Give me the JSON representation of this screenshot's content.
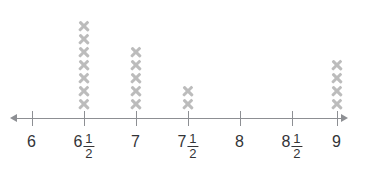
{
  "chart_data": {
    "type": "scatter",
    "plot_style": "line-plot-x-marks",
    "title": "",
    "subtitle": "",
    "xlabel": "",
    "ylabel": "",
    "grid": false,
    "legend": "none",
    "xlim": [
      6,
      9
    ],
    "categories": [
      "6",
      "6½",
      "7",
      "7½",
      "8",
      "8½",
      "9"
    ],
    "x": [
      6,
      6.5,
      7,
      7.5,
      8,
      8.5,
      9
    ],
    "values": [
      0,
      7,
      5,
      2,
      0,
      0,
      4
    ],
    "marker": "x",
    "marker_color": "#bcbcbc",
    "axis_color": "#8d8f93",
    "label_color": "#333437",
    "ticks": [
      {
        "id": "tick-6",
        "value": 6,
        "x_px": 32,
        "whole": "6",
        "numerator": "",
        "denominator": "",
        "count": 0
      },
      {
        "id": "tick-6-half",
        "value": 6.5,
        "x_px": 84,
        "whole": "6",
        "numerator": "1",
        "denominator": "2",
        "count": 7
      },
      {
        "id": "tick-7",
        "value": 7,
        "x_px": 136,
        "whole": "7",
        "numerator": "",
        "denominator": "",
        "count": 5
      },
      {
        "id": "tick-7-half",
        "value": 7.5,
        "x_px": 188,
        "whole": "7",
        "numerator": "1",
        "denominator": "2",
        "count": 2
      },
      {
        "id": "tick-8",
        "value": 8,
        "x_px": 240,
        "whole": "8",
        "numerator": "",
        "denominator": "",
        "count": 0
      },
      {
        "id": "tick-8-half",
        "value": 8.5,
        "x_px": 292,
        "whole": "8",
        "numerator": "1",
        "denominator": "2",
        "count": 0
      },
      {
        "id": "tick-9",
        "value": 9,
        "x_px": 337,
        "whole": "9",
        "numerator": "",
        "denominator": "",
        "count": 4
      }
    ],
    "annotations": {
      "clipped_side_text_lines": [
        "",
        "",
        ""
      ]
    }
  }
}
